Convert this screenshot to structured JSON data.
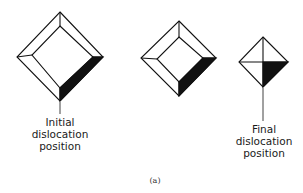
{
  "figure": {
    "caption": "(a)",
    "stages": [
      {
        "name": "initial",
        "label_lines": [
          "Initial",
          "dislocation",
          "position"
        ]
      },
      {
        "name": "intermediate",
        "label_lines": []
      },
      {
        "name": "final",
        "label_lines": [
          "Final",
          "dislocation",
          "position"
        ]
      }
    ],
    "colors": {
      "stroke": "#111111",
      "fill_dark": "#111111",
      "background": "#ffffff"
    }
  }
}
